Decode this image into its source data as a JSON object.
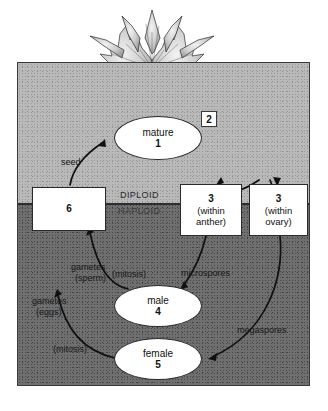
{
  "figure": {
    "regions": {
      "diploid_label": "DIPLOID",
      "haploid_label": "HAPLOID"
    }
  },
  "nodes": {
    "mature": {
      "line1": "mature",
      "line2": "1"
    },
    "flower": {
      "number": "2"
    },
    "anther": {
      "number": "3",
      "sub_line1": "(within",
      "sub_line2": "anther)"
    },
    "ovary": {
      "number": "3",
      "sub_line1": "(within",
      "sub_line2": "ovary)"
    },
    "male": {
      "line1": "male",
      "line2": "4"
    },
    "female": {
      "line1": "female",
      "line2": "5"
    },
    "seedbox": {
      "number": "6"
    }
  },
  "edge_labels": {
    "seed": "seed",
    "microspores": "microspores",
    "megaspores": "megaspores",
    "gametes_sperm_line1": "gametes",
    "gametes_sperm_line2": "(sperm)",
    "mitosis_male": "(mitosis)",
    "gametes_eggs_line1": "gametes",
    "gametes_eggs_line2": "(eggs)",
    "mitosis_female": "(mitosis)"
  },
  "colors": {
    "panel_border": "#3a3a3a",
    "upper_background": "#b9b9b9",
    "lower_background": "#6f6f6f",
    "divider": "#2e2e2e",
    "node_fill": "#ffffff",
    "node_stroke": "#2a2a2a",
    "arrow": "#101010",
    "text": "#111111"
  }
}
